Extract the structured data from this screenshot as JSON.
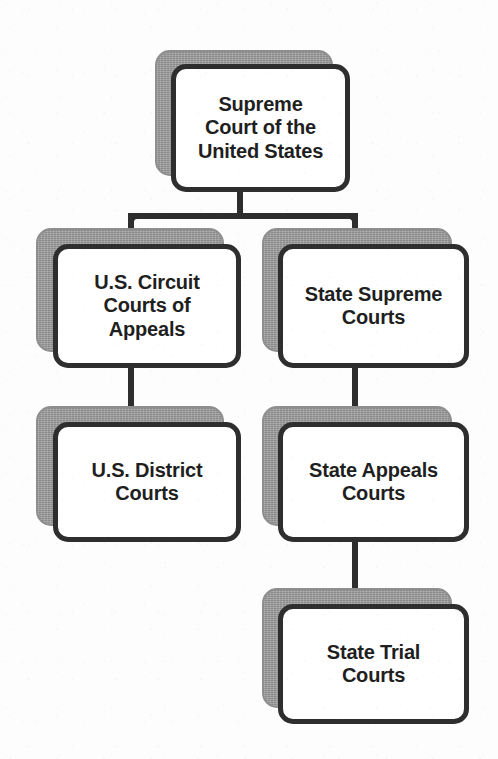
{
  "diagram": {
    "type": "hierarchy-tree",
    "background_color": "#ffffff",
    "box_fill_color": "#ffffff",
    "box_border_color": "#2e2e2e",
    "box_shadow_color": "#9a9a9a",
    "connector_color": "#2e2e2e",
    "nodes": [
      {
        "id": "supreme-court-us",
        "label": "Supreme\nCourt of the\nUnited States",
        "level": 1,
        "branch": "root"
      },
      {
        "id": "us-circuit-courts-of-appeals",
        "label": "U.S. Circuit\nCourts of\nAppeals",
        "level": 2,
        "branch": "federal"
      },
      {
        "id": "state-supreme-courts",
        "label": "State Supreme\nCourts",
        "level": 2,
        "branch": "state"
      },
      {
        "id": "us-district-courts",
        "label": "U.S. District\nCourts",
        "level": 3,
        "branch": "federal"
      },
      {
        "id": "state-appeals-courts",
        "label": "State Appeals\nCourts",
        "level": 3,
        "branch": "state"
      },
      {
        "id": "state-trial-courts",
        "label": "State Trial\nCourts",
        "level": 4,
        "branch": "state"
      }
    ],
    "edges": [
      {
        "from": "supreme-court-us",
        "to": "us-circuit-courts-of-appeals"
      },
      {
        "from": "supreme-court-us",
        "to": "state-supreme-courts"
      },
      {
        "from": "us-circuit-courts-of-appeals",
        "to": "us-district-courts"
      },
      {
        "from": "state-supreme-courts",
        "to": "state-appeals-courts"
      },
      {
        "from": "state-appeals-courts",
        "to": "state-trial-courts"
      }
    ]
  }
}
